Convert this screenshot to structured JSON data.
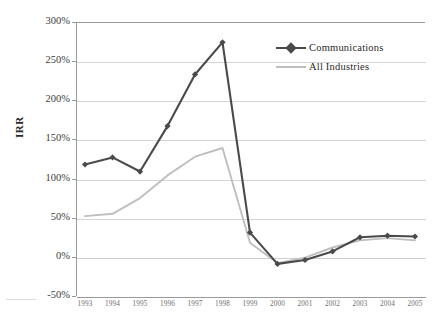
{
  "chart_data": {
    "type": "line",
    "title": "",
    "xlabel": "",
    "ylabel": "IRR",
    "categories": [
      "1993",
      "1994",
      "1995",
      "1996",
      "1997",
      "1998",
      "1999",
      "2000",
      "2001",
      "2002",
      "2003",
      "2004",
      "2005"
    ],
    "x": [
      1993,
      1994,
      1995,
      1996,
      1997,
      1998,
      1999,
      2000,
      2001,
      2002,
      2003,
      2004,
      2005
    ],
    "series": [
      {
        "name": "Communications",
        "color": "#4a4a4a",
        "marker": "diamond",
        "values": [
          118,
          127,
          109,
          167,
          233,
          274,
          31,
          -9,
          -4,
          7,
          25,
          27,
          26
        ]
      },
      {
        "name": "All Industries",
        "color": "#bfbfbf",
        "marker": "none",
        "values": [
          52,
          55,
          75,
          104,
          128,
          139,
          18,
          -8,
          -1,
          12,
          21,
          24,
          21
        ]
      }
    ],
    "ylim": [
      -50,
      300
    ],
    "ytick_values": [
      300,
      250,
      200,
      150,
      100,
      50,
      0,
      -50
    ],
    "ytick_labels": [
      "300%",
      "250%",
      "200%",
      "150%",
      "100%",
      "50%",
      "0%",
      "-50%"
    ],
    "yunit": "percent",
    "grid": true,
    "grid_axis": "y",
    "legend_position": "top-right",
    "legend_entries": [
      "Communications",
      "All Industries"
    ]
  },
  "axes": {
    "y_title": "IRR"
  },
  "legend": {
    "items": [
      {
        "label": "Communications"
      },
      {
        "label": "All Industries"
      }
    ]
  },
  "colors": {
    "communications": "#4a4a4a",
    "all_industries": "#bfbfbf",
    "gridline": "#d4d4d4",
    "axis": "#9a9a9a",
    "background": "#ffffff",
    "tick_text": "#3d3d3d",
    "xtick_text": "#6d6d6d"
  }
}
